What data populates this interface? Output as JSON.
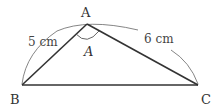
{
  "diagram": {
    "type": "triangle",
    "vertices": {
      "A": {
        "label": "A",
        "x": 87,
        "y": 24
      },
      "B": {
        "label": "B",
        "x": 22,
        "y": 85
      },
      "C": {
        "label": "C",
        "x": 198,
        "y": 85
      }
    },
    "angle_label": "A",
    "sides": {
      "AB": {
        "label": "5 cm"
      },
      "AC": {
        "label": "6 cm"
      }
    },
    "colors": {
      "edge": "#333333",
      "arc": "#555555",
      "text": "#333333"
    }
  }
}
